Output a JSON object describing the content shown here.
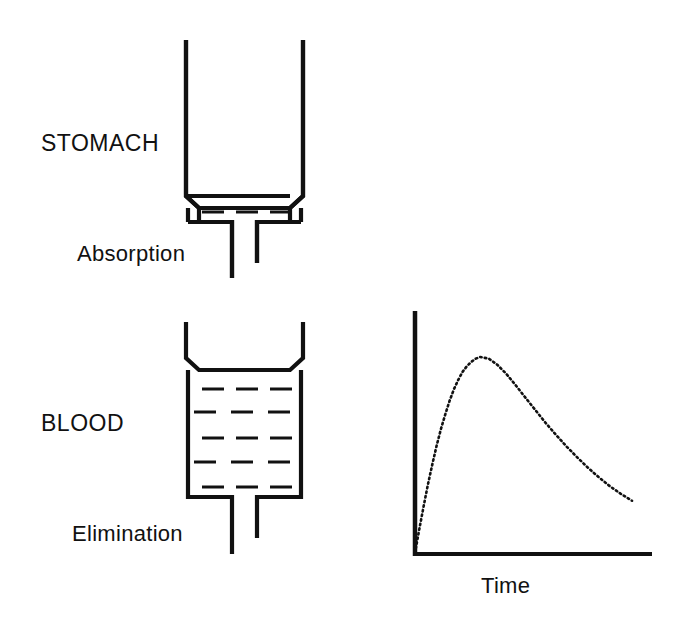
{
  "figure": {
    "background_color": "#ffffff",
    "ink_color": "#111111"
  },
  "labels": {
    "stomach": "STOMACH",
    "blood": "BLOOD",
    "absorption": "Absorption",
    "elimination": "Elimination",
    "time": "Time"
  },
  "compartments": [
    {
      "name": "stomach",
      "label": "STOMACH",
      "outlet_label": "Absorption",
      "fill_rows": 1,
      "dashes_per_row": 3,
      "fill_level": "low"
    },
    {
      "name": "blood",
      "label": "BLOOD",
      "outlet_label": "Elimination",
      "fill_rows": 5,
      "dashes_per_row": 3,
      "fill_level": "high"
    }
  ],
  "chart_data": {
    "type": "line",
    "title": "",
    "xlabel": "Time",
    "ylabel": "",
    "grid": false,
    "legend": null,
    "style": "dotted",
    "axis_ticks": false,
    "tick_labels": [],
    "xlim": [
      0,
      1
    ],
    "ylim": [
      0,
      1
    ],
    "series": [
      {
        "name": "Blood concentration",
        "x": [
          0.0,
          0.02,
          0.04,
          0.06,
          0.08,
          0.1,
          0.12,
          0.14,
          0.16,
          0.18,
          0.2,
          0.22,
          0.24,
          0.26,
          0.28,
          0.3,
          0.34,
          0.38,
          0.42,
          0.46,
          0.5,
          0.55,
          0.6,
          0.65,
          0.7,
          0.75,
          0.8,
          0.85,
          0.9,
          0.95,
          1.0
        ],
        "y": [
          0.0,
          0.115,
          0.225,
          0.33,
          0.425,
          0.515,
          0.595,
          0.665,
          0.73,
          0.785,
          0.83,
          0.868,
          0.895,
          0.915,
          0.93,
          0.938,
          0.93,
          0.9,
          0.858,
          0.808,
          0.755,
          0.69,
          0.625,
          0.565,
          0.508,
          0.455,
          0.405,
          0.36,
          0.318,
          0.282,
          0.25
        ]
      }
    ]
  }
}
